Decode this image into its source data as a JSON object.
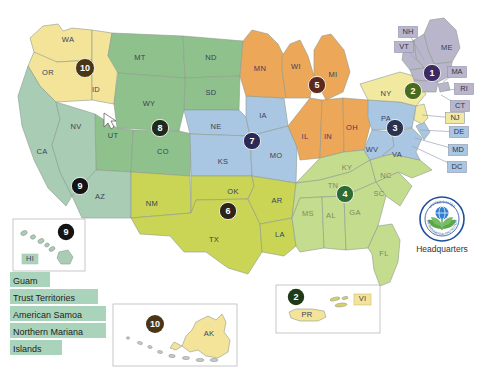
{
  "map": {
    "name": "us-epa-regions-map",
    "regions": [
      {
        "id": 1,
        "number": "1",
        "badge_color": "#3d2a63",
        "fill": "#b9b6cc"
      },
      {
        "id": 2,
        "number": "2",
        "badge_color": "#4a6b1e",
        "fill": "#f2e9a0"
      },
      {
        "id": 3,
        "number": "3",
        "badge_color": "#2b3150",
        "fill": "#a9c7e2"
      },
      {
        "id": 4,
        "number": "4",
        "badge_color": "#2c6b33",
        "fill": "#c3dc8e"
      },
      {
        "id": 5,
        "number": "5",
        "badge_color": "#5b2a1c",
        "fill": "#eda758"
      },
      {
        "id": 6,
        "number": "6",
        "badge_color": "#2e2418",
        "fill": "#cad455"
      },
      {
        "id": 7,
        "number": "7",
        "badge_color": "#2b2a56",
        "fill": "#a9c7e2"
      },
      {
        "id": 8,
        "number": "8",
        "badge_color": "#1f2a1c",
        "fill": "#8fc18d"
      },
      {
        "id": 9,
        "number": "9",
        "badge_color": "#141414",
        "fill": "#a8cdb4"
      },
      {
        "id": 10,
        "number": "10",
        "badge_color": "#4a3516",
        "fill": "#f3e49a"
      }
    ],
    "state_labels": [
      {
        "abbr": "WA",
        "x": 68,
        "y": 40,
        "light": false
      },
      {
        "abbr": "OR",
        "x": 48,
        "y": 73,
        "light": false
      },
      {
        "abbr": "ID",
        "x": 96,
        "y": 90,
        "light": false
      },
      {
        "abbr": "MT",
        "x": 140,
        "y": 58,
        "light": false
      },
      {
        "abbr": "ND",
        "x": 211,
        "y": 58,
        "light": false
      },
      {
        "abbr": "SD",
        "x": 211,
        "y": 93,
        "light": false
      },
      {
        "abbr": "WY",
        "x": 149,
        "y": 104,
        "light": false
      },
      {
        "abbr": "NV",
        "x": 76,
        "y": 127,
        "light": false
      },
      {
        "abbr": "UT",
        "x": 113,
        "y": 136,
        "light": false
      },
      {
        "abbr": "CO",
        "x": 163,
        "y": 152,
        "light": false
      },
      {
        "abbr": "NE",
        "x": 216,
        "y": 127,
        "light": false
      },
      {
        "abbr": "KS",
        "x": 223,
        "y": 162,
        "light": false
      },
      {
        "abbr": "CA",
        "x": 42,
        "y": 152,
        "light": false
      },
      {
        "abbr": "AZ",
        "x": 100,
        "y": 197,
        "light": false
      },
      {
        "abbr": "NM",
        "x": 152,
        "y": 204,
        "light": false
      },
      {
        "abbr": "TX",
        "x": 214,
        "y": 240,
        "light": false
      },
      {
        "abbr": "OK",
        "x": 233,
        "y": 192,
        "light": false
      },
      {
        "abbr": "MN",
        "x": 260,
        "y": 69,
        "light": false
      },
      {
        "abbr": "IA",
        "x": 263,
        "y": 116,
        "light": false
      },
      {
        "abbr": "MO",
        "x": 276,
        "y": 156,
        "light": false
      },
      {
        "abbr": "AR",
        "x": 277,
        "y": 201,
        "light": false
      },
      {
        "abbr": "LA",
        "x": 280,
        "y": 235,
        "light": false
      },
      {
        "abbr": "WI",
        "x": 296,
        "y": 67,
        "light": false
      },
      {
        "abbr": "MI",
        "x": 333,
        "y": 75,
        "light": false
      },
      {
        "abbr": "IL",
        "x": 305,
        "y": 137,
        "light": false
      },
      {
        "abbr": "IN",
        "x": 328,
        "y": 137,
        "light": false
      },
      {
        "abbr": "OH",
        "x": 352,
        "y": 128,
        "light": false
      },
      {
        "abbr": "KY",
        "x": 347,
        "y": 168,
        "light": true
      },
      {
        "abbr": "TN",
        "x": 333,
        "y": 186,
        "light": true
      },
      {
        "abbr": "MS",
        "x": 308,
        "y": 214,
        "light": true
      },
      {
        "abbr": "AL",
        "x": 331,
        "y": 216,
        "light": true
      },
      {
        "abbr": "GA",
        "x": 355,
        "y": 213,
        "light": true
      },
      {
        "abbr": "FL",
        "x": 384,
        "y": 254,
        "light": true
      },
      {
        "abbr": "SC",
        "x": 379,
        "y": 194,
        "light": true
      },
      {
        "abbr": "NC",
        "x": 386,
        "y": 176,
        "light": true
      },
      {
        "abbr": "VA",
        "x": 397,
        "y": 155,
        "light": false
      },
      {
        "abbr": "WV",
        "x": 372,
        "y": 150,
        "light": false
      },
      {
        "abbr": "PA",
        "x": 386,
        "y": 119,
        "light": false
      },
      {
        "abbr": "NY",
        "x": 386,
        "y": 94,
        "light": false
      },
      {
        "abbr": "ME",
        "x": 447,
        "y": 48,
        "light": false
      }
    ],
    "badges_on_map": [
      {
        "number": "10",
        "x": 85,
        "y": 68,
        "color": "#4a3516"
      },
      {
        "number": "8",
        "x": 160,
        "y": 128,
        "color": "#1f2a1c"
      },
      {
        "number": "9",
        "x": 80,
        "y": 186,
        "color": "#141414"
      },
      {
        "number": "6",
        "x": 228,
        "y": 211,
        "color": "#2e2418"
      },
      {
        "number": "7",
        "x": 252,
        "y": 141,
        "color": "#2b2a56"
      },
      {
        "number": "5",
        "x": 317,
        "y": 85,
        "color": "#5b2a1c"
      },
      {
        "number": "4",
        "x": 345,
        "y": 194,
        "color": "#2c6b33"
      },
      {
        "number": "3",
        "x": 395,
        "y": 128,
        "color": "#2b3150"
      },
      {
        "number": "2",
        "x": 413,
        "y": 91,
        "color": "#4a6b1e"
      },
      {
        "number": "1",
        "x": 432,
        "y": 73,
        "color": "#3d2a63"
      }
    ],
    "callouts": [
      {
        "abbr": "NH",
        "x": 408,
        "y": 32,
        "fill": "#b9b6cc",
        "lx": 424,
        "ly": 60
      },
      {
        "abbr": "VT",
        "x": 404,
        "y": 47,
        "fill": "#b9b6cc",
        "lx": 418,
        "ly": 62
      },
      {
        "abbr": "MA",
        "x": 457,
        "y": 72,
        "fill": "#b9b6cc",
        "lx": 443,
        "ly": 82
      },
      {
        "abbr": "RI",
        "x": 464,
        "y": 89,
        "fill": "#b9b6cc",
        "lx": 446,
        "ly": 90
      },
      {
        "abbr": "CT",
        "x": 460,
        "y": 106,
        "fill": "#b9b6cc",
        "lx": 441,
        "ly": 95
      },
      {
        "abbr": "NJ",
        "x": 455,
        "y": 118,
        "fill": "#f2e9a0",
        "lx": 422,
        "ly": 115
      },
      {
        "abbr": "DE",
        "x": 459,
        "y": 132,
        "fill": "#a9c7e2",
        "lx": 420,
        "ly": 130
      },
      {
        "abbr": "MD",
        "x": 458,
        "y": 150,
        "fill": "#a9c7e2",
        "lx": 415,
        "ly": 138
      },
      {
        "abbr": "DC",
        "x": 457,
        "y": 167,
        "fill": "#a9c7e2",
        "lx": 412,
        "ly": 146
      }
    ]
  },
  "insets": {
    "hawaii": {
      "name": "hawaii-inset",
      "label": "HI",
      "badge": "9",
      "badge_color": "#141414"
    },
    "alaska": {
      "name": "alaska-inset",
      "label": "AK",
      "badge": "10",
      "badge_color": "#4a3516"
    },
    "caribbean": {
      "name": "caribbean-inset",
      "labels": [
        "PR",
        "VI"
      ],
      "badge": "2",
      "badge_color": "#1f3a16"
    }
  },
  "legend": {
    "name": "territories-legend",
    "highlight_color": "#a9d4bb",
    "items": [
      {
        "label": "Guam"
      },
      {
        "label": "Trust Territories"
      },
      {
        "label": "American Samoa"
      },
      {
        "label": "Northern Mariana"
      },
      {
        "label": "Islands"
      }
    ]
  },
  "headquarters": {
    "name": "epa-headquarters",
    "label": "Headquarters",
    "seal_text_top": "UNITED STATES",
    "seal_text_bottom": "ENVIRONMENTAL PROTECTION",
    "ring_color": "#1f4e9c",
    "leaf_color": "#5aa84a"
  },
  "cursor": {
    "name": "mouse-cursor",
    "x": 104,
    "y": 117
  }
}
